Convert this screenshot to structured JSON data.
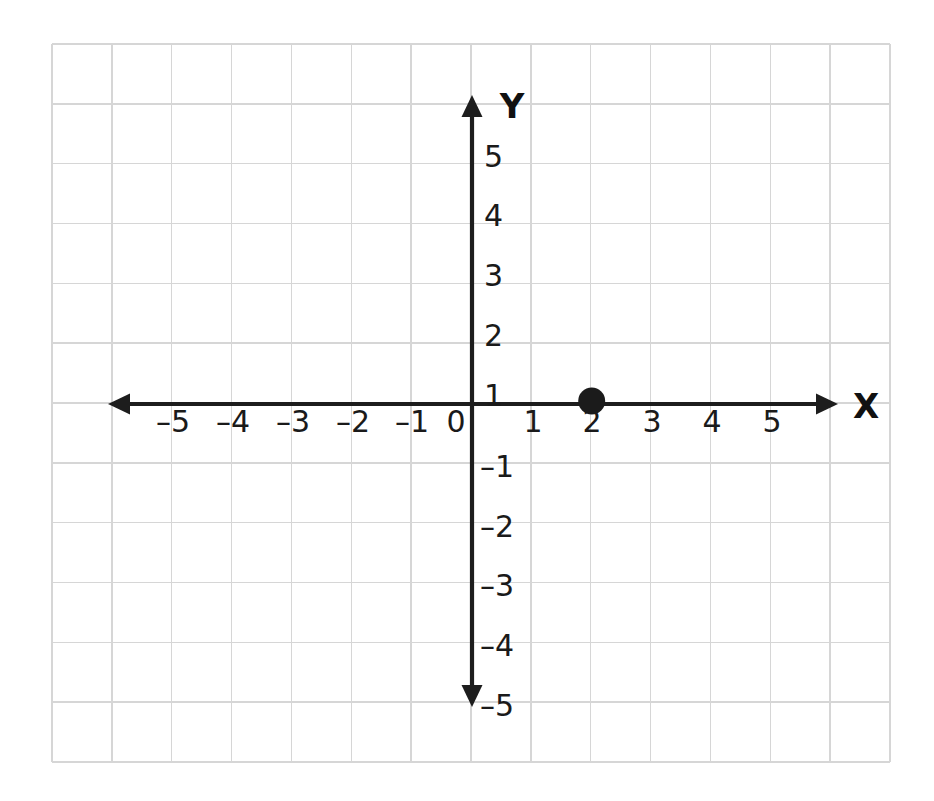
{
  "figure": {
    "title": "",
    "background_color": "#ffffff",
    "width": 934,
    "height": 801
  },
  "chart_data": {
    "type": "scatter",
    "title": "",
    "xlabel": "X",
    "ylabel": "Y",
    "xlim": [
      -7,
      7
    ],
    "ylim": [
      -6,
      6
    ],
    "grid": true,
    "legend": null,
    "x_tick_labels": [
      "–5",
      "–4",
      "–3",
      "–2",
      "–1",
      "0",
      "1",
      "2",
      "3",
      "4",
      "5"
    ],
    "y_tick_labels": [
      "5",
      "4",
      "3",
      "2",
      "1",
      "–1",
      "–2",
      "–3",
      "–4",
      "–5"
    ],
    "x_tick_values": [
      -5,
      -4,
      -3,
      -2,
      -1,
      0,
      1,
      2,
      3,
      4,
      5
    ],
    "y_tick_values": [
      5,
      4,
      3,
      2,
      1,
      -1,
      -2,
      -3,
      -4,
      -5
    ],
    "points": [
      {
        "label": "(2, 0)",
        "x": 2,
        "y": 0
      }
    ],
    "series": [
      {
        "name": "plotted-point",
        "x": [
          2
        ],
        "y": [
          0
        ],
        "marker": "filled-circle",
        "color": "#1b1b1b"
      }
    ]
  },
  "axes": {
    "x_axis_label": "X",
    "y_axis_label": "Y",
    "axis_color": "#1d1d1d",
    "grid_color": "#d6d6d6"
  },
  "geometry": {
    "origin_x": 472,
    "origin_y": 404,
    "unit": 59.85,
    "grid_left": 52,
    "grid_top": 44,
    "grid_right": 890,
    "grid_bottom": 762,
    "grid_cols": 14,
    "grid_rows": 12,
    "x_axis_left_tip": 108,
    "x_axis_right_tip": 838,
    "y_axis_top_tip": 95,
    "y_axis_bottom_tip": 707,
    "point_radius": 13.5
  },
  "labels": {
    "x_ticks": [
      {
        "text": "–5",
        "px": 173,
        "py": 432
      },
      {
        "text": "–4",
        "px": 233,
        "py": 432
      },
      {
        "text": "–3",
        "px": 293,
        "py": 432
      },
      {
        "text": "–2",
        "px": 353,
        "py": 432
      },
      {
        "text": "–1",
        "px": 412,
        "py": 432
      },
      {
        "text": "0",
        "px": 456,
        "py": 432
      },
      {
        "text": "1",
        "px": 533,
        "py": 432
      },
      {
        "text": "2",
        "px": 592,
        "py": 432
      },
      {
        "text": "3",
        "px": 652,
        "py": 432
      },
      {
        "text": "4",
        "px": 712,
        "py": 432
      },
      {
        "text": "5",
        "px": 772,
        "py": 432
      }
    ],
    "y_ticks": [
      {
        "text": "5",
        "px": 484,
        "py": 167
      },
      {
        "text": "4",
        "px": 484,
        "py": 226
      },
      {
        "text": "3",
        "px": 484,
        "py": 286
      },
      {
        "text": "2",
        "px": 484,
        "py": 346
      },
      {
        "text": "1",
        "px": 484,
        "py": 406
      },
      {
        "text": "–1",
        "px": 480,
        "py": 477
      },
      {
        "text": "–2",
        "px": 480,
        "py": 537
      },
      {
        "text": "–3",
        "px": 480,
        "py": 596
      },
      {
        "text": "–4",
        "px": 480,
        "py": 656
      },
      {
        "text": "–5",
        "px": 480,
        "py": 716
      }
    ],
    "axis_names": [
      {
        "text": "Y",
        "px": 512,
        "py": 118
      },
      {
        "text": "X",
        "px": 866,
        "py": 418
      }
    ]
  }
}
